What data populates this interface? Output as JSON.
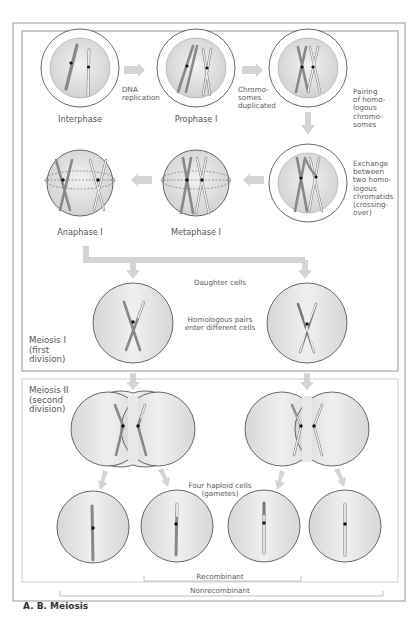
{
  "figure": {
    "caption": "A. B. Meiosis",
    "colors": {
      "frame": "#9a9a9a",
      "inner_frame": "#c8c8c8",
      "meiosis2_frame": "#e2e2e2",
      "cell_fill": "#dcdcdc",
      "cell_stroke": "#444444",
      "arrow": "#cfcfcf",
      "dark_chromosome": "#8c8c8c",
      "light_chromosome": "#e6e6e6",
      "centromere": "#111111"
    }
  },
  "meiosis1": {
    "section_label": "Meiosis I\n(first\ndivision)",
    "stages": [
      {
        "id": "interphase",
        "label": "Interphase"
      },
      {
        "id": "prophase",
        "label": "Prophase I"
      },
      {
        "id": "pairing",
        "label": ""
      },
      {
        "id": "crossing",
        "label": ""
      },
      {
        "id": "metaphase",
        "label": "Metaphase I"
      },
      {
        "id": "anaphase",
        "label": "Anaphase I"
      }
    ],
    "transitions": {
      "dna_replication": "DNA\nreplication",
      "chromosomes_duplicated": "Chromo-\nsomes\nduplicated",
      "pairing": "Pairing\nof homo-\nlogous\nchromo-\nsomes",
      "exchange": "Exchange\nbetween\ntwo homo-\nlogous\nchromatids\n(crossing-\nover)"
    },
    "daughter_cells_label": "Daughter cells",
    "homologous_pairs_label": "Homologous pairs\nenter different cells"
  },
  "meiosis2": {
    "section_label": "Meiosis II\n(second\ndivision)",
    "gametes_label": "Four haploid cells\n(gametes)",
    "brackets": {
      "recombinant": "Recombinant",
      "nonrecombinant": "Nonrecombinant"
    }
  }
}
